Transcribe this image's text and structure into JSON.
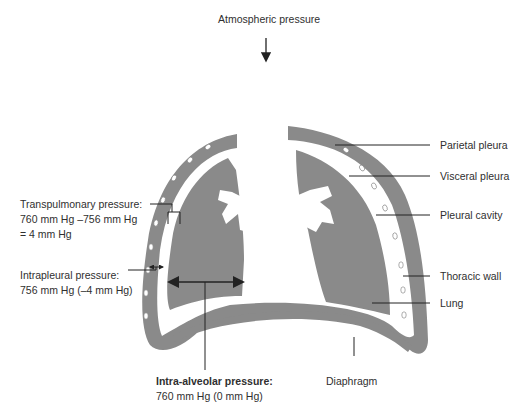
{
  "diagram": {
    "title": "Atmospheric pressure",
    "colors": {
      "tissue": "#8a8a8a",
      "background": "#ffffff",
      "line": "#222222",
      "text": "#2f2f2f"
    },
    "right_labels": [
      {
        "id": "parietal",
        "text": "Parietal pleura"
      },
      {
        "id": "visceral",
        "text": "Visceral pleura"
      },
      {
        "id": "cavity",
        "text": "Pleural cavity"
      },
      {
        "id": "wall",
        "text": "Thoracic wall"
      },
      {
        "id": "lung",
        "text": "Lung"
      }
    ],
    "transpulmonary": {
      "line1": "Transpulmonary pressure:",
      "line2": "760 mm Hg –756 mm Hg",
      "line3": "= 4 mm Hg"
    },
    "intrapleural": {
      "line1": "Intrapleural pressure:",
      "line2": "756 mm Hg (–4 mm Hg)"
    },
    "intraalveolar": {
      "line1": "Intra-alveolar pressure:",
      "line2": "760 mm Hg (0 mm Hg)"
    },
    "diaphragm": "Diaphragm"
  }
}
